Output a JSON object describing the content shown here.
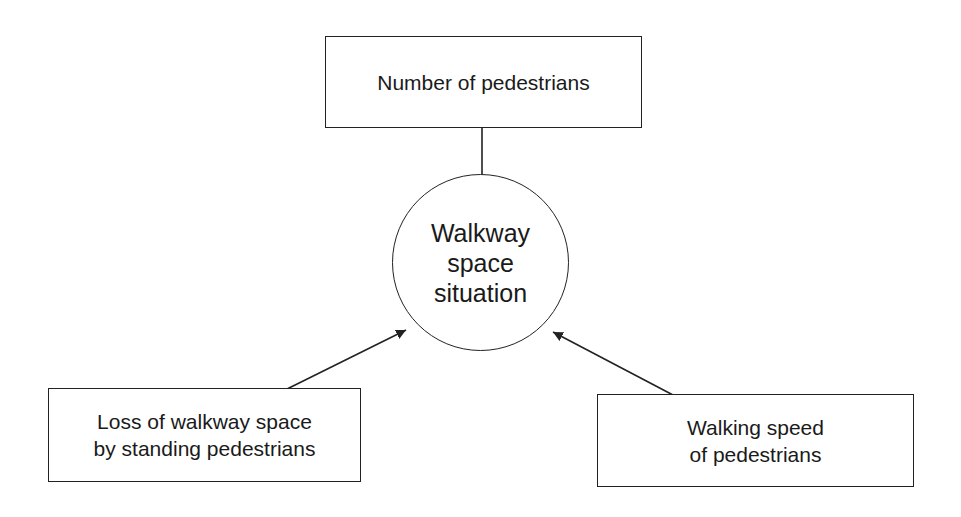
{
  "diagram": {
    "type": "influence-diagram",
    "center": {
      "id": "walkway-space-situation",
      "lines": [
        "Walkway",
        "space",
        "situation"
      ],
      "shape": "circle"
    },
    "inputs": [
      {
        "id": "number-of-pedestrians",
        "lines": [
          "Number of pedestrians"
        ],
        "position": "top"
      },
      {
        "id": "loss-of-walkway-space",
        "lines": [
          "Loss of walkway space",
          "by standing pedestrians"
        ],
        "position": "bottom-left"
      },
      {
        "id": "walking-speed",
        "lines": [
          "Walking speed",
          "of pedestrians"
        ],
        "position": "bottom-right"
      }
    ],
    "edges": [
      {
        "from": "number-of-pedestrians",
        "to": "walkway-space-situation"
      },
      {
        "from": "loss-of-walkway-space",
        "to": "walkway-space-situation"
      },
      {
        "from": "walking-speed",
        "to": "walkway-space-situation"
      }
    ],
    "colors": {
      "stroke": "#222222",
      "text": "#1a1a1a",
      "background": "#ffffff"
    }
  }
}
